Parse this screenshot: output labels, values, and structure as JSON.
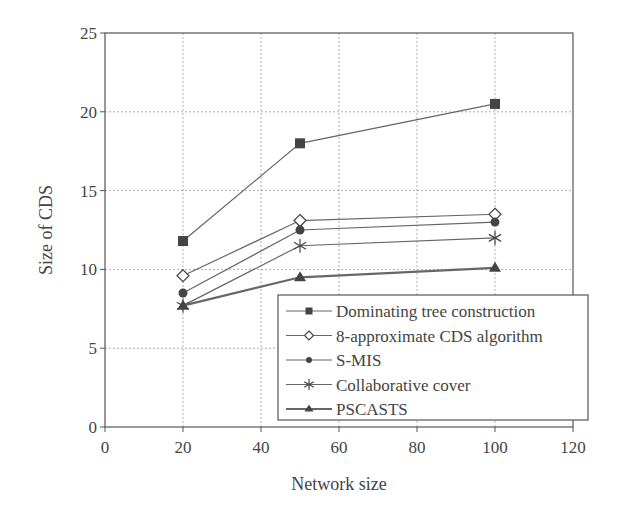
{
  "chart_data": {
    "type": "line",
    "title": "",
    "xlabel": "Network size",
    "ylabel": "Size of CDS",
    "xlim": [
      0,
      120
    ],
    "ylim": [
      0,
      25
    ],
    "xticks": [
      0,
      20,
      40,
      60,
      80,
      100,
      120
    ],
    "yticks": [
      0,
      5,
      10,
      15,
      20,
      25
    ],
    "grid": true,
    "legend_position": "lower right",
    "x": [
      20,
      50,
      100
    ],
    "series": [
      {
        "name": "Dominating tree construction",
        "marker": "filled-square",
        "values": [
          11.8,
          18.0,
          20.5
        ]
      },
      {
        "name": "8-approximate CDS algorithm",
        "marker": "open-diamond",
        "values": [
          9.6,
          13.1,
          13.5
        ]
      },
      {
        "name": "S-MIS",
        "marker": "filled-circle",
        "values": [
          8.5,
          12.5,
          13.0
        ]
      },
      {
        "name": "Collaborative cover",
        "marker": "asterisk",
        "values": [
          7.7,
          11.5,
          12.0
        ]
      },
      {
        "name": "PSCASTS",
        "marker": "filled-triangle",
        "values": [
          7.7,
          9.5,
          10.1
        ]
      }
    ]
  },
  "colors": {
    "axis": "#555555",
    "grid": "#9a9a9a",
    "line": "#666666",
    "marker": "#444444"
  }
}
